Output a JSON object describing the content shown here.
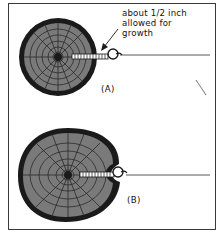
{
  "figure": {
    "callout_lines": [
      "about 1/2 inch",
      "allowed for",
      "growth"
    ],
    "panels": [
      {
        "id": "A",
        "label": "(A)",
        "description": "Round log with screw eye and wire; gap left between log surface and eye"
      },
      {
        "id": "B",
        "label": "(B)",
        "description": "Log has grown around the screw eye after years of growth"
      }
    ],
    "colors": {
      "bark": "#1a1a1a",
      "wood": "#7a7a7a",
      "rings": "#2a2a2a",
      "wire": "#444444",
      "frame": "#3a3a3a"
    }
  }
}
